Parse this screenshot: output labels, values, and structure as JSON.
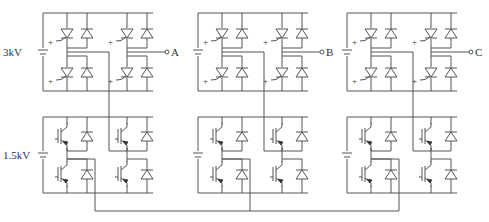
{
  "diagram": {
    "labels": {
      "top_voltage": "3kV",
      "bottom_voltage": "1.5kV",
      "phase_a": "A",
      "phase_b": "B",
      "phase_c": "C",
      "gate_plus": "+"
    },
    "modules": [
      {
        "x": 43,
        "phase": "A",
        "out_label": "A"
      },
      {
        "x": 198,
        "phase": "B",
        "out_label": "B"
      },
      {
        "x": 347,
        "phase": "C",
        "out_label": "C"
      }
    ],
    "top_cell": {
      "device": "thyristor",
      "top": 13,
      "bottom": 91,
      "width": 110
    },
    "bottom_cell": {
      "device": "igbt",
      "top": 117,
      "bottom": 193,
      "width": 110
    },
    "bottom_rail_y": 211,
    "colors": {
      "wire": "#555555",
      "text": "#333333",
      "background": "#ffffff"
    }
  }
}
